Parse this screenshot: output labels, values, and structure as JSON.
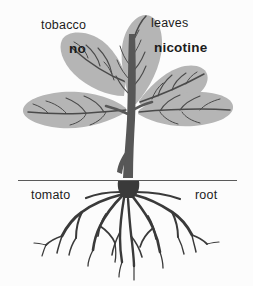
{
  "figure": {
    "name": "grafted-tobacco-tomato-plant-diagram",
    "background_color": "#fcfcfc"
  },
  "labels": {
    "top_left_plain": "tobacco",
    "top_right_plain": "leaves",
    "top_left_bold": "no",
    "top_right_bold": "nicotine",
    "bottom_left": "tomato",
    "bottom_right": "root"
  },
  "colors": {
    "leaf_fill": "#b5b5b5",
    "leaf_vein": "#4a4a4a",
    "stem": "#575757",
    "root": "#3a3a3a",
    "ground_line": "#5a5a5a",
    "text": "#1c1c1c"
  },
  "ground_line": {
    "label": "soil-surface-line",
    "x_start": 18,
    "x_end": 237,
    "y": 180
  }
}
